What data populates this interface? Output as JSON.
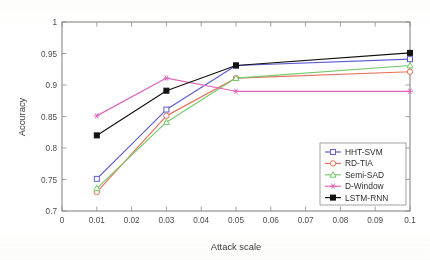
{
  "chart_data": {
    "type": "line",
    "title": "",
    "xlabel": "Attack scale",
    "ylabel": "Accuracy",
    "x": [
      0.01,
      0.03,
      0.05,
      0.1
    ],
    "xlim": [
      0,
      0.1
    ],
    "ylim": [
      0.7,
      1
    ],
    "xticks": [
      0,
      0.01,
      0.02,
      0.03,
      0.04,
      0.05,
      0.06,
      0.07,
      0.08,
      0.09,
      0.1
    ],
    "xticklabels": [
      "0",
      "0.01",
      "0.02",
      "0.03",
      "0.04",
      "0.05",
      "0.06",
      "0.07",
      "0.08",
      "0.09",
      "0.1"
    ],
    "yticks": [
      0.7,
      0.75,
      0.8,
      0.85,
      0.9,
      0.95,
      1
    ],
    "yticklabels": [
      "0.7",
      "0.75",
      "0.8",
      "0.85",
      "0.9",
      "0.95",
      "1"
    ],
    "grid": false,
    "legend_position": "lower right",
    "series": [
      {
        "name": "HHT-SVM",
        "color": "#5b5bd6",
        "marker": "square",
        "filled": false,
        "values": [
          0.751,
          0.861,
          0.931,
          0.941
        ]
      },
      {
        "name": "RD-TIA",
        "color": "#e8705a",
        "marker": "circle",
        "filled": false,
        "values": [
          0.73,
          0.851,
          0.911,
          0.921
        ]
      },
      {
        "name": "Semi-SAD",
        "color": "#74c96a",
        "marker": "triangle",
        "filled": false,
        "values": [
          0.736,
          0.841,
          0.911,
          0.931
        ]
      },
      {
        "name": "D-Window",
        "color": "#df63b8",
        "marker": "star",
        "filled": false,
        "values": [
          0.851,
          0.911,
          0.89,
          0.89
        ]
      },
      {
        "name": "LSTM-RNN",
        "color": "#111111",
        "marker": "square",
        "filled": true,
        "values": [
          0.82,
          0.891,
          0.931,
          0.951
        ]
      }
    ]
  },
  "axes": {
    "xlabel": "Attack scale",
    "ylabel": "Accuracy"
  },
  "legend": {
    "entries": [
      {
        "label": "HHT-SVM"
      },
      {
        "label": "RD-TIA"
      },
      {
        "label": "Semi-SAD"
      },
      {
        "label": "D-Window"
      },
      {
        "label": "LSTM-RNN"
      }
    ]
  }
}
